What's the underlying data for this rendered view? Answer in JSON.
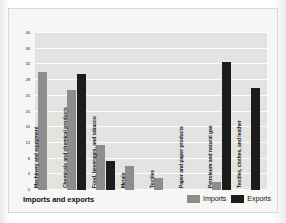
{
  "chart_data": {
    "type": "bar",
    "title": "Imports and exports",
    "xlabel": "",
    "ylabel": "",
    "ylim": [
      0,
      40
    ],
    "yticks": [
      0,
      4,
      8,
      12,
      16,
      20,
      24,
      28,
      32,
      36,
      40
    ],
    "grid": true,
    "legend_position": "bottom-right",
    "categories": [
      "Machinery and equipment",
      "Chemicals and chemical products",
      "Food, beverages, and tobacco",
      "Metals",
      "Textiles",
      "Paper and paper products",
      "Petroleum and natural gas",
      "Textiles, clothes, and leather"
    ],
    "series": [
      {
        "name": "Imports",
        "color": "#8d8d8b",
        "values": [
          30,
          25.5,
          11.5,
          6,
          3,
          0,
          2,
          0
        ]
      },
      {
        "name": "Exports",
        "color": "#1c1c1c",
        "values": [
          0,
          29.5,
          7.5,
          0,
          0,
          0,
          32.5,
          26
        ]
      }
    ]
  },
  "footer": {
    "title": "Imports and exports"
  }
}
